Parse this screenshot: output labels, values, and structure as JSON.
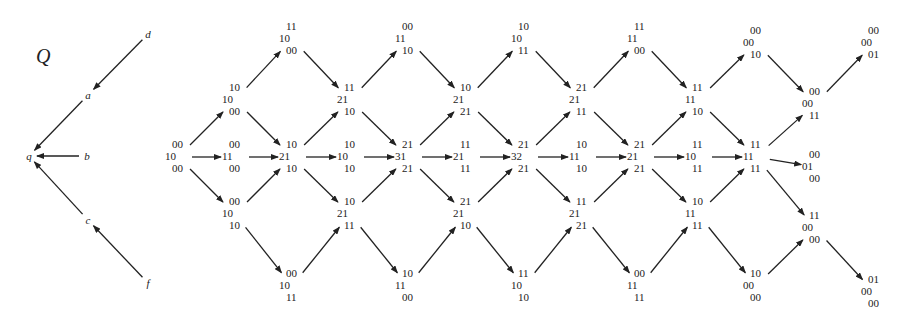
{
  "quiver": {
    "title": "Q",
    "vertices": [
      {
        "id": "d",
        "x": 148,
        "y": 34
      },
      {
        "id": "a",
        "x": 88,
        "y": 95
      },
      {
        "id": "q",
        "x": 29,
        "y": 156
      },
      {
        "id": "b",
        "x": 87,
        "y": 156
      },
      {
        "id": "c",
        "x": 88,
        "y": 220
      },
      {
        "id": "f",
        "x": 148,
        "y": 283
      }
    ],
    "arrows": [
      {
        "from": "d",
        "to": "a"
      },
      {
        "from": "a",
        "to": "q"
      },
      {
        "from": "b",
        "to": "q"
      },
      {
        "from": "c",
        "to": "q"
      },
      {
        "from": "f",
        "to": "c"
      }
    ]
  },
  "ar_quiver": {
    "nodes": [
      {
        "id": "n0",
        "x": 178,
        "y": 157,
        "lines": [
          "00",
          "10",
          "00"
        ]
      },
      {
        "id": "n1",
        "x": 235,
        "y": 100,
        "lines": [
          "10",
          "10",
          "00"
        ]
      },
      {
        "id": "n2",
        "x": 235,
        "y": 157,
        "lines": [
          "00",
          "11",
          "00"
        ]
      },
      {
        "id": "n3",
        "x": 235,
        "y": 214,
        "lines": [
          "00",
          "10",
          "10"
        ]
      },
      {
        "id": "n4",
        "x": 292,
        "y": 39,
        "lines": [
          "11",
          "10",
          "00"
        ]
      },
      {
        "id": "n5",
        "x": 292,
        "y": 157,
        "lines": [
          "10",
          "21",
          "10"
        ]
      },
      {
        "id": "n6",
        "x": 292,
        "y": 286,
        "lines": [
          "00",
          "10",
          "11"
        ]
      },
      {
        "id": "n7",
        "x": 350,
        "y": 100,
        "lines": [
          "11",
          "21",
          "10"
        ]
      },
      {
        "id": "n8",
        "x": 350,
        "y": 157,
        "lines": [
          "10",
          "10",
          "10"
        ]
      },
      {
        "id": "n9",
        "x": 350,
        "y": 214,
        "lines": [
          "10",
          "21",
          "11"
        ]
      },
      {
        "id": "n10",
        "x": 408,
        "y": 39,
        "lines": [
          "00",
          "11",
          "10"
        ]
      },
      {
        "id": "n11",
        "x": 408,
        "y": 157,
        "lines": [
          "21",
          "31",
          "21"
        ]
      },
      {
        "id": "n12",
        "x": 408,
        "y": 286,
        "lines": [
          "10",
          "11",
          "00"
        ]
      },
      {
        "id": "n13",
        "x": 466,
        "y": 100,
        "lines": [
          "10",
          "21",
          "21"
        ]
      },
      {
        "id": "n14",
        "x": 466,
        "y": 157,
        "lines": [
          "11",
          "21",
          "11"
        ]
      },
      {
        "id": "n15",
        "x": 466,
        "y": 214,
        "lines": [
          "21",
          "21",
          "10"
        ]
      },
      {
        "id": "n16",
        "x": 524,
        "y": 39,
        "lines": [
          "10",
          "10",
          "11"
        ]
      },
      {
        "id": "n17",
        "x": 524,
        "y": 157,
        "lines": [
          "21",
          "32",
          "21"
        ]
      },
      {
        "id": "n18",
        "x": 524,
        "y": 286,
        "lines": [
          "11",
          "10",
          "10"
        ]
      },
      {
        "id": "n19",
        "x": 582,
        "y": 100,
        "lines": [
          "21",
          "21",
          "11"
        ]
      },
      {
        "id": "n20",
        "x": 582,
        "y": 157,
        "lines": [
          "10",
          "11",
          "10"
        ]
      },
      {
        "id": "n21",
        "x": 582,
        "y": 214,
        "lines": [
          "11",
          "21",
          "21"
        ]
      },
      {
        "id": "n22",
        "x": 640,
        "y": 39,
        "lines": [
          "11",
          "11",
          "00"
        ]
      },
      {
        "id": "n23",
        "x": 640,
        "y": 157,
        "lines": [
          "21",
          "21",
          "21"
        ]
      },
      {
        "id": "n24",
        "x": 640,
        "y": 286,
        "lines": [
          "00",
          "11",
          "11"
        ]
      },
      {
        "id": "n25",
        "x": 698,
        "y": 100,
        "lines": [
          "11",
          "11",
          "10"
        ]
      },
      {
        "id": "n26",
        "x": 698,
        "y": 157,
        "lines": [
          "11",
          "10",
          "11"
        ]
      },
      {
        "id": "n27",
        "x": 698,
        "y": 214,
        "lines": [
          "10",
          "11",
          "11"
        ]
      },
      {
        "id": "n28",
        "x": 756,
        "y": 43,
        "lines": [
          "00",
          "00",
          "10"
        ]
      },
      {
        "id": "n29",
        "x": 756,
        "y": 157,
        "lines": [
          "11",
          "11",
          "11"
        ]
      },
      {
        "id": "n30",
        "x": 756,
        "y": 286,
        "lines": [
          "10",
          "00",
          "00"
        ]
      },
      {
        "id": "n31",
        "x": 815,
        "y": 104,
        "lines": [
          "00",
          "00",
          "11"
        ]
      },
      {
        "id": "n32",
        "x": 815,
        "y": 167,
        "lines": [
          "00",
          "01",
          "00"
        ]
      },
      {
        "id": "n33",
        "x": 815,
        "y": 228,
        "lines": [
          "11",
          "00",
          "00"
        ]
      },
      {
        "id": "n34",
        "x": 874,
        "y": 43,
        "lines": [
          "00",
          "00",
          "01"
        ]
      },
      {
        "id": "n35",
        "x": 874,
        "y": 292,
        "lines": [
          "01",
          "00",
          "00"
        ]
      }
    ],
    "arrows": [
      [
        "n0",
        "n1"
      ],
      [
        "n0",
        "n2"
      ],
      [
        "n0",
        "n3"
      ],
      [
        "n1",
        "n4"
      ],
      [
        "n1",
        "n5"
      ],
      [
        "n2",
        "n5"
      ],
      [
        "n3",
        "n5"
      ],
      [
        "n3",
        "n6"
      ],
      [
        "n4",
        "n7"
      ],
      [
        "n5",
        "n7"
      ],
      [
        "n5",
        "n8"
      ],
      [
        "n5",
        "n9"
      ],
      [
        "n6",
        "n9"
      ],
      [
        "n7",
        "n10"
      ],
      [
        "n7",
        "n11"
      ],
      [
        "n8",
        "n11"
      ],
      [
        "n9",
        "n11"
      ],
      [
        "n9",
        "n12"
      ],
      [
        "n10",
        "n13"
      ],
      [
        "n11",
        "n13"
      ],
      [
        "n11",
        "n14"
      ],
      [
        "n11",
        "n15"
      ],
      [
        "n12",
        "n15"
      ],
      [
        "n13",
        "n16"
      ],
      [
        "n13",
        "n17"
      ],
      [
        "n14",
        "n17"
      ],
      [
        "n15",
        "n17"
      ],
      [
        "n15",
        "n18"
      ],
      [
        "n16",
        "n19"
      ],
      [
        "n17",
        "n19"
      ],
      [
        "n17",
        "n20"
      ],
      [
        "n17",
        "n21"
      ],
      [
        "n18",
        "n21"
      ],
      [
        "n19",
        "n22"
      ],
      [
        "n19",
        "n23"
      ],
      [
        "n20",
        "n23"
      ],
      [
        "n21",
        "n23"
      ],
      [
        "n21",
        "n24"
      ],
      [
        "n22",
        "n25"
      ],
      [
        "n23",
        "n25"
      ],
      [
        "n23",
        "n26"
      ],
      [
        "n23",
        "n27"
      ],
      [
        "n24",
        "n27"
      ],
      [
        "n25",
        "n28"
      ],
      [
        "n25",
        "n29"
      ],
      [
        "n26",
        "n29"
      ],
      [
        "n27",
        "n29"
      ],
      [
        "n27",
        "n30"
      ],
      [
        "n28",
        "n31"
      ],
      [
        "n29",
        "n31"
      ],
      [
        "n29",
        "n32"
      ],
      [
        "n29",
        "n33"
      ],
      [
        "n30",
        "n33"
      ],
      [
        "n31",
        "n34"
      ],
      [
        "n33",
        "n35"
      ]
    ]
  }
}
